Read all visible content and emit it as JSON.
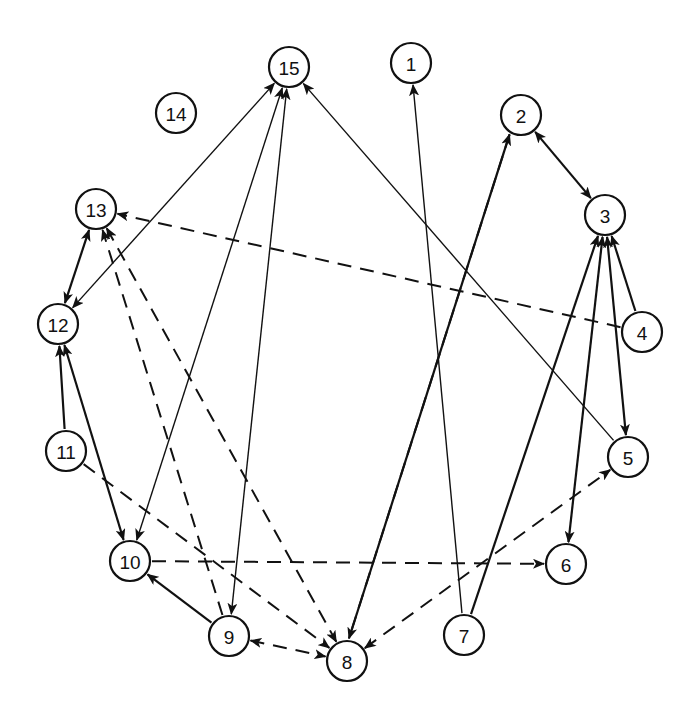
{
  "diagram": {
    "type": "directed-graph",
    "layout": "circular",
    "colors": {
      "stroke": "#111111",
      "background": "#ffffff",
      "node_fill": "#ffffff"
    },
    "node_radius": 20,
    "nodes": [
      {
        "id": "1",
        "label": "1",
        "x": 411,
        "y": 63
      },
      {
        "id": "2",
        "label": "2",
        "x": 521,
        "y": 115
      },
      {
        "id": "3",
        "label": "3",
        "x": 605,
        "y": 215
      },
      {
        "id": "4",
        "label": "4",
        "x": 642,
        "y": 332
      },
      {
        "id": "5",
        "label": "5",
        "x": 628,
        "y": 457
      },
      {
        "id": "6",
        "label": "6",
        "x": 566,
        "y": 564
      },
      {
        "id": "7",
        "label": "7",
        "x": 464,
        "y": 635
      },
      {
        "id": "8",
        "label": "8",
        "x": 347,
        "y": 661
      },
      {
        "id": "9",
        "label": "9",
        "x": 229,
        "y": 636
      },
      {
        "id": "10",
        "label": "10",
        "x": 130,
        "y": 561
      },
      {
        "id": "11",
        "label": "11",
        "x": 66,
        "y": 451
      },
      {
        "id": "12",
        "label": "12",
        "x": 58,
        "y": 324
      },
      {
        "id": "13",
        "label": "13",
        "x": 96,
        "y": 209
      },
      {
        "id": "14",
        "label": "14",
        "x": 176,
        "y": 113
      },
      {
        "id": "15",
        "label": "15",
        "x": 289,
        "y": 67
      }
    ],
    "edges": [
      {
        "from": "7",
        "to": "1",
        "style": "solid-thin",
        "bidirectional": false
      },
      {
        "from": "8",
        "to": "2",
        "style": "solid-thick",
        "bidirectional": false,
        "offset": -5
      },
      {
        "from": "2",
        "to": "8",
        "style": "dashed",
        "bidirectional": false,
        "offset": 5
      },
      {
        "from": "2",
        "to": "3",
        "style": "solid-thick",
        "bidirectional": true
      },
      {
        "from": "7",
        "to": "3",
        "style": "solid-thick",
        "bidirectional": false
      },
      {
        "from": "6",
        "to": "3",
        "style": "solid-thick",
        "bidirectional": true
      },
      {
        "from": "3",
        "to": "5",
        "style": "solid-thick",
        "bidirectional": true
      },
      {
        "from": "4",
        "to": "3",
        "style": "solid-thick",
        "bidirectional": false
      },
      {
        "from": "4",
        "to": "13",
        "style": "dashed",
        "bidirectional": false
      },
      {
        "from": "5",
        "to": "15",
        "style": "solid-thin",
        "bidirectional": false
      },
      {
        "from": "8",
        "to": "5",
        "style": "dashed",
        "bidirectional": true
      },
      {
        "from": "10",
        "to": "6",
        "style": "dashed",
        "bidirectional": false
      },
      {
        "from": "9",
        "to": "8",
        "style": "dashed",
        "bidirectional": true
      },
      {
        "from": "9",
        "to": "10",
        "style": "solid-thick",
        "bidirectional": false
      },
      {
        "from": "9",
        "to": "13",
        "style": "dashed",
        "bidirectional": false
      },
      {
        "from": "13",
        "to": "8",
        "style": "dashed",
        "bidirectional": true
      },
      {
        "from": "11",
        "to": "8",
        "style": "dashed",
        "bidirectional": false
      },
      {
        "from": "11",
        "to": "12",
        "style": "solid-thick",
        "bidirectional": false
      },
      {
        "from": "12",
        "to": "10",
        "style": "solid-thick",
        "bidirectional": true
      },
      {
        "from": "12",
        "to": "13",
        "style": "solid-thick",
        "bidirectional": true
      },
      {
        "from": "12",
        "to": "15",
        "style": "solid-thin",
        "bidirectional": true
      },
      {
        "from": "10",
        "to": "15",
        "style": "solid-thin",
        "bidirectional": true
      },
      {
        "from": "9",
        "to": "15",
        "style": "solid-thin",
        "bidirectional": true
      }
    ]
  }
}
